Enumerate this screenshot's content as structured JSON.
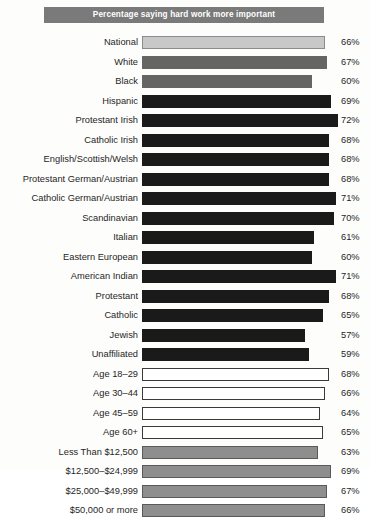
{
  "header": {
    "title": "Percentage saying hard work more important"
  },
  "chart_data": {
    "type": "bar",
    "orientation": "horizontal",
    "title": "Percentage saying hard work more important",
    "xlabel": "",
    "ylabel": "",
    "xlim": [
      0,
      100
    ],
    "grid": false,
    "legend": "none",
    "value_suffix": "%",
    "categories": [
      "National",
      "White",
      "Black",
      "Hispanic",
      "Protestant Irish",
      "Catholic Irish",
      "English/Scottish/Welsh",
      "Protestant German/Austrian",
      "Catholic German/Austrian",
      "Scandinavian",
      "Italian",
      "Eastern European",
      "American Indian",
      "Protestant",
      "Catholic",
      "Jewish",
      "Unaffiliated",
      "Age 18–29",
      "Age 30–44",
      "Age 45–59",
      "Age 60+",
      "Less Than $12,500",
      "$12,500–$24,999",
      "$25,000–$49,999",
      "$50,000 or more"
    ],
    "values": [
      66,
      67,
      60,
      69,
      72,
      68,
      68,
      68,
      71,
      70,
      61,
      60,
      71,
      68,
      65,
      57,
      59,
      68,
      66,
      64,
      65,
      63,
      69,
      67,
      66
    ],
    "value_labels": [
      "66%",
      "67%",
      "60%",
      "69%",
      "72%",
      "68%",
      "68%",
      "68%",
      "71%",
      "70%",
      "61%",
      "60%",
      "71%",
      "68%",
      "65%",
      "57%",
      "59%",
      "68%",
      "66%",
      "64%",
      "65%",
      "63%",
      "69%",
      "67%",
      "66%"
    ],
    "bar_styles": [
      "light",
      "mid",
      "mid",
      "dark",
      "dark",
      "dark",
      "dark",
      "dark",
      "dark",
      "dark",
      "dark",
      "dark",
      "dark",
      "dark",
      "dark",
      "dark",
      "dark",
      "hollow",
      "hollow",
      "hollow",
      "hollow",
      "gray",
      "gray",
      "gray",
      "gray"
    ]
  },
  "colors": {
    "title_band": "#7a7a7a",
    "title_text": "#ffffff",
    "bar_dark": "#1a1a1a",
    "bar_mid": "#656565",
    "bar_light": "#c8c8c8",
    "bar_gray": "#8e8e8e",
    "bar_hollow": "#ffffff",
    "label_text": "#1f1f1f",
    "background": "#fdfdfc"
  }
}
